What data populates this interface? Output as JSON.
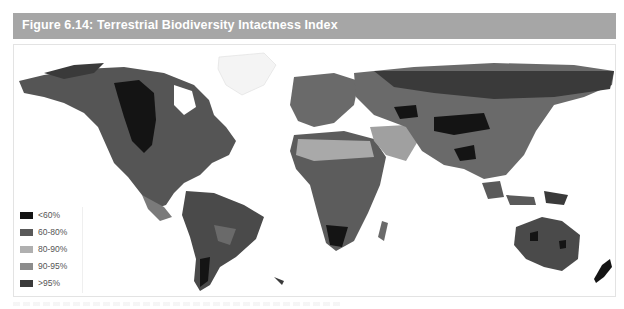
{
  "figure": {
    "title": "Figure 6.14: Terrestrial Biodiversity Intactness Index",
    "header_color": "#a6a6a6"
  },
  "map": {
    "type": "world choropleth",
    "description": "Grayscale world map shaded by biodiversity intactness",
    "legend": {
      "items": [
        {
          "label": "<60%",
          "color": "#141414"
        },
        {
          "label": "60-80%",
          "color": "#595959"
        },
        {
          "label": "80-90%",
          "color": "#b0b0b0"
        },
        {
          "label": "90-95%",
          "color": "#8c8c8c"
        },
        {
          "label": ">95%",
          "color": "#3a3a3a"
        }
      ]
    }
  }
}
